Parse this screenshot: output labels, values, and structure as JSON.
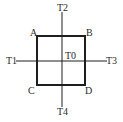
{
  "diagram": {
    "type": "square-with-crosshair",
    "colors": {
      "stroke": "#1e1e1e",
      "text": "#2a2a2a",
      "background": "#ffffff"
    },
    "square": {
      "x": 37,
      "y": 36,
      "width": 48,
      "height": 49
    },
    "axes": {
      "horizontal": {
        "y": 61,
        "x1": 16,
        "x2": 107
      },
      "vertical": {
        "x": 62,
        "y1": 12,
        "y2": 107
      }
    },
    "labels": {
      "A": "A",
      "B": "B",
      "C": "C",
      "D": "D",
      "T0": "T0",
      "T1": "T1",
      "T2": "T2",
      "T3": "T3",
      "T4": "T4"
    }
  }
}
